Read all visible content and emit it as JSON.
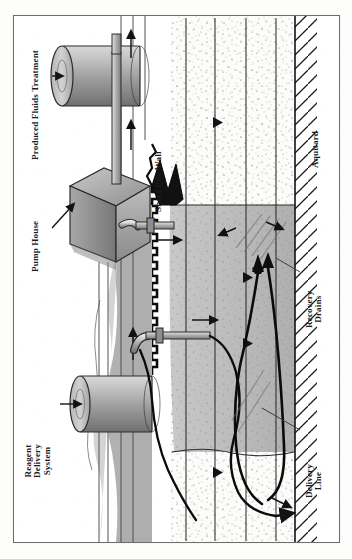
{
  "figure": {
    "domain": "engineering-cross-section",
    "orientation": "rotated-90-counterclockwise",
    "background_color": "#ffffff",
    "frame_color": "#6e6e6e",
    "ink_color": "#1b1b1b"
  },
  "labels": {
    "produced_fluids_treatment": "Produced Fluids Treatment",
    "pump_house": "Pump House",
    "reagent_delivery_system": "Reagent\nDelivery\nSystem",
    "sheet_pile_wall": "Sheet Pile Wall",
    "aquitard": "Aquitard",
    "recovery_drains": "Recovery\nDrains",
    "delivery_line": "Delivery\nLine"
  },
  "components": {
    "treatment_tank": {
      "name": "Produced Fluids Treatment Tank",
      "shape": "horizontal-cylinder",
      "fill": "#9b9b9b"
    },
    "reagent_tank": {
      "name": "Reagent Delivery Tank",
      "shape": "horizontal-cylinder",
      "fill": "#9b9b9b"
    },
    "pump_house_building": {
      "name": "Pump House",
      "shape": "angled-box",
      "fill": "#9a9a9a"
    },
    "sheet_pile_wall_graphic": {
      "name": "Sheet Pile Wall",
      "style": "zigzag-corrugated",
      "fill": "#111111"
    },
    "aquitard_layer": {
      "name": "Aquitard",
      "style": "diagonal-hatch",
      "fill": "#ffffff"
    },
    "saturated_zone": {
      "name": "Treated / Saturated Zone",
      "fill": "#b4b4b4"
    },
    "vadose_zone": {
      "name": "Unsaturated Soil",
      "fill": "#fbfbfb",
      "texture": "stipple"
    },
    "recovery_drain_pipes": {
      "name": "Recovery Drains",
      "count": 2,
      "stroke": "#0d0d0d"
    },
    "delivery_line_pipe": {
      "name": "Delivery Line",
      "stroke": "#0d0d0d"
    }
  },
  "flow": {
    "groundwater_arrows": 4,
    "riser_arrows": 3,
    "injection_arrows": 2,
    "recovery_arrows": 3
  }
}
